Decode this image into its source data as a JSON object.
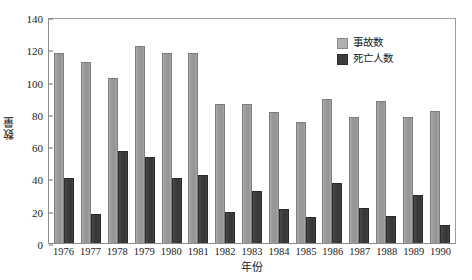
{
  "chart_data": {
    "type": "bar",
    "title": "",
    "xlabel": "年份",
    "ylabel": "数量",
    "ylim": [
      0,
      140
    ],
    "ytick_step": 20,
    "yticks": [
      0,
      20,
      40,
      60,
      80,
      100,
      120,
      140
    ],
    "grid": false,
    "legend_position": "top-right",
    "categories": [
      "1976",
      "1977",
      "1978",
      "1979",
      "1980",
      "1981",
      "1982",
      "1983",
      "1984",
      "1985",
      "1986",
      "1987",
      "1988",
      "1989",
      "1990"
    ],
    "series": [
      {
        "name": "事故数",
        "color": "#9a9a9a",
        "values": [
          118,
          112,
          102,
          122,
          118,
          118,
          86,
          86,
          81,
          75,
          89,
          78,
          88,
          78,
          82
        ]
      },
      {
        "name": "死亡人数",
        "color": "#3b3b3b",
        "values": [
          40,
          18,
          57,
          53,
          40,
          42,
          19,
          32,
          21,
          16,
          37,
          22,
          17,
          30,
          11
        ]
      }
    ]
  },
  "legend": {
    "items": [
      {
        "label": "事故数",
        "swatch": "light-gray-swatch"
      },
      {
        "label": "死亡人数",
        "swatch": "dark-gray-swatch"
      }
    ]
  },
  "axes": {
    "y_title": "数量",
    "x_title": "年份",
    "y_tick_labels": [
      "140",
      "120",
      "100",
      "80",
      "60",
      "40",
      "20",
      "0"
    ],
    "x_tick_labels": [
      "1976",
      "1977",
      "1978",
      "1979",
      "1980",
      "1981",
      "1982",
      "1983",
      "1984",
      "1985",
      "1986",
      "1987",
      "1988",
      "1989",
      "1990"
    ]
  },
  "colors": {
    "accidents_bar": "#9a9a9a",
    "deaths_bar": "#3b3b3b",
    "axis_line": "#8e8e8e",
    "background": "#ffffff",
    "text": "#1a1a1a"
  }
}
